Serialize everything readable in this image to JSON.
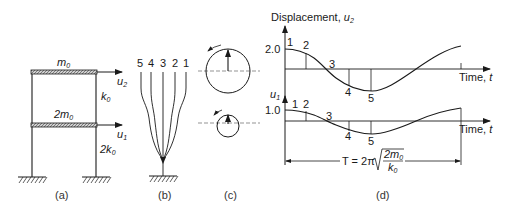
{
  "panel_a": {
    "caption": "(a)",
    "top_mass": "m",
    "top_mass_sub": "0",
    "top_disp": "u",
    "top_disp_sub": "2",
    "top_stiff": "k",
    "top_stiff_sub": "0",
    "bottom_mass": "2m",
    "bottom_mass_sub": "0",
    "bottom_disp": "u",
    "bottom_disp_sub": "1",
    "bottom_stiff": "2k",
    "bottom_stiff_sub": "0"
  },
  "panel_b": {
    "caption": "(b)",
    "mode_labels": [
      "5",
      "4",
      "3",
      "2",
      "1"
    ]
  },
  "panel_c": {
    "caption": "(c)"
  },
  "panel_d": {
    "caption": "(d)",
    "y_title": "Displacement, ",
    "y_title_var": "u",
    "y_title_sub": "2",
    "top_peak_label": "2.0",
    "bottom_var": "u",
    "bottom_var_sub": "1",
    "bottom_peak_label": "1.0",
    "time_label": "Time, ",
    "time_var": "t",
    "point_labels": [
      "1",
      "2",
      "3",
      "4",
      "5"
    ],
    "period_lhs": "T = 2π",
    "period_num": "2m",
    "period_num_sub": "0",
    "period_den": "k",
    "period_den_sub": "0"
  },
  "colors": {
    "ink": "#1a1a1a",
    "hatch_fill": "#bdbdbd"
  }
}
